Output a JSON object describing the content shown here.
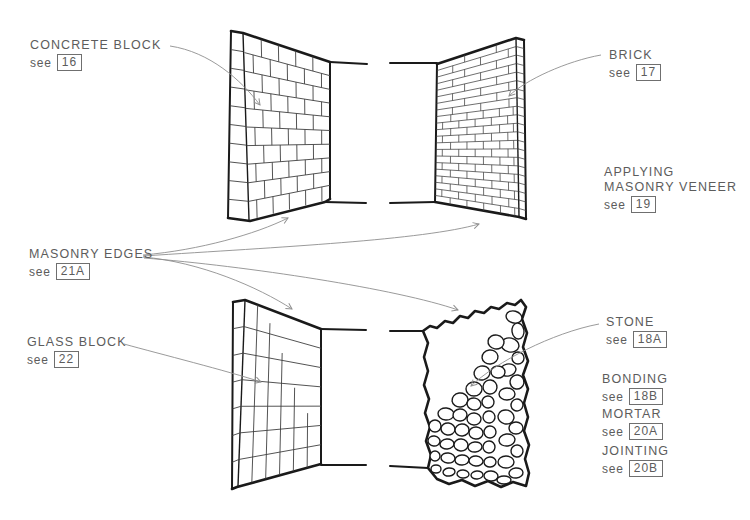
{
  "labels": {
    "concrete_block": {
      "title": "CONCRETE BLOCK",
      "see": "see",
      "ref": "16"
    },
    "brick": {
      "title": "BRICK",
      "see": "see",
      "ref": "17"
    },
    "applying_masonry_veneer": {
      "line1": "APPLYING",
      "line2": "MASONRY VENEER",
      "see": "see",
      "ref": "19"
    },
    "masonry_edges": {
      "title": "MASONRY EDGES",
      "see": "see",
      "ref": "21A"
    },
    "glass_block": {
      "title": "GLASS BLOCK",
      "see": "see",
      "ref": "22"
    },
    "stone": {
      "title": "STONE",
      "see": "see",
      "ref": "18A"
    },
    "bonding": {
      "title": "BONDING",
      "see": "see",
      "ref": "18B"
    },
    "mortar": {
      "title": "MORTAR",
      "see": "see",
      "ref": "20A"
    },
    "jointing": {
      "title": "JOINTING",
      "see": "see",
      "ref": "20B"
    }
  },
  "colors": {
    "background": "#ffffff",
    "ink": "#1a1a1a",
    "joint": "#3f3f3f",
    "leader": "#8f8f8f",
    "text": "#5c5c5c",
    "ref_box_border": "#6f6f6f"
  }
}
